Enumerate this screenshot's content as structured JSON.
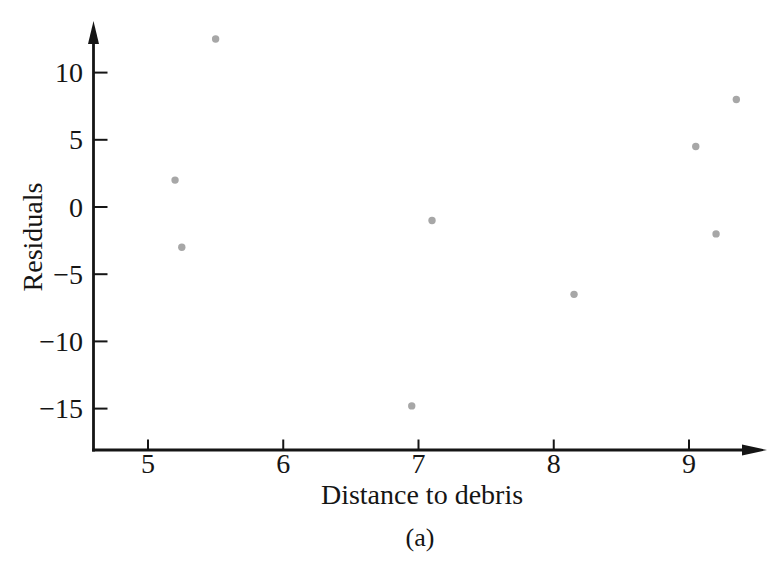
{
  "figure": {
    "caption": "(a)"
  },
  "chart_data": {
    "type": "scatter",
    "title": "",
    "xlabel": "Distance to debris",
    "ylabel": "Residuals",
    "grid": false,
    "legend": "none",
    "axis_color": "#151515",
    "point_color": "#a7a7a7",
    "x_axis": {
      "range_shown": [
        4.6,
        9.7
      ],
      "ticks": [
        {
          "value": 5,
          "label": "5"
        },
        {
          "value": 6,
          "label": "6"
        },
        {
          "value": 7,
          "label": "7"
        },
        {
          "value": 8,
          "label": "8"
        },
        {
          "value": 9,
          "label": "9"
        }
      ]
    },
    "y_axis": {
      "range_shown": [
        -17.5,
        14
      ],
      "ticks": [
        {
          "value": 10,
          "label": "10"
        },
        {
          "value": 5,
          "label": "5"
        },
        {
          "value": 0,
          "label": "0"
        },
        {
          "value": -5,
          "label": "−5"
        },
        {
          "value": -10,
          "label": "−10"
        },
        {
          "value": -15,
          "label": "−15"
        }
      ]
    },
    "points": [
      {
        "x": 5.5,
        "y": 12.5
      },
      {
        "x": 5.2,
        "y": 2
      },
      {
        "x": 5.25,
        "y": -3
      },
      {
        "x": 6.95,
        "y": -14.8
      },
      {
        "x": 7.1,
        "y": -1
      },
      {
        "x": 8.15,
        "y": -6.5
      },
      {
        "x": 9.05,
        "y": 4.5
      },
      {
        "x": 9.2,
        "y": -2
      },
      {
        "x": 9.35,
        "y": 8
      }
    ]
  }
}
